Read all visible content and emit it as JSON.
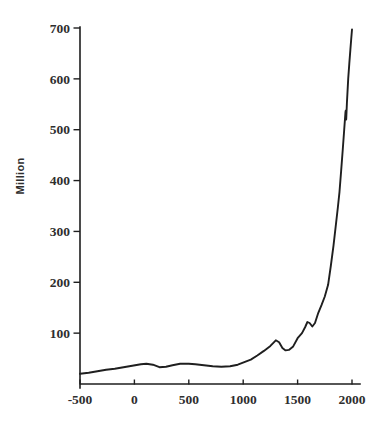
{
  "window": {
    "width": 381,
    "height": 423,
    "background": "#ffffff"
  },
  "chart_data": {
    "type": "line",
    "ylabel": "Million",
    "x_ticks": [
      -500,
      0,
      500,
      1000,
      1500,
      2000
    ],
    "x_tick_labels": [
      "-500",
      "0",
      "500",
      "1000",
      "1500",
      "2000"
    ],
    "y_ticks": [
      100,
      200,
      300,
      400,
      500,
      600,
      700
    ],
    "y_tick_labels": [
      "100",
      "200",
      "300",
      "400",
      "500",
      "600",
      "700"
    ],
    "xlim": [
      -500,
      2000
    ],
    "ylim": [
      0,
      700
    ],
    "grid": false,
    "legend": false,
    "line_color": "#1f1f1f",
    "axis_color": "#1f1f1f",
    "label_color": "#2e2e2e",
    "series": [
      {
        "name": "population-million",
        "points": [
          [
            -500,
            20
          ],
          [
            -420,
            22
          ],
          [
            -340,
            25
          ],
          [
            -260,
            28
          ],
          [
            -180,
            30
          ],
          [
            -100,
            33
          ],
          [
            -20,
            36
          ],
          [
            60,
            39
          ],
          [
            110,
            40
          ],
          [
            170,
            38
          ],
          [
            230,
            33
          ],
          [
            290,
            34
          ],
          [
            350,
            37
          ],
          [
            420,
            40
          ],
          [
            500,
            40
          ],
          [
            560,
            39
          ],
          [
            640,
            37
          ],
          [
            720,
            35
          ],
          [
            800,
            34
          ],
          [
            880,
            35
          ],
          [
            950,
            38
          ],
          [
            1010,
            43
          ],
          [
            1070,
            48
          ],
          [
            1130,
            56
          ],
          [
            1190,
            65
          ],
          [
            1250,
            75
          ],
          [
            1300,
            86
          ],
          [
            1330,
            82
          ],
          [
            1360,
            71
          ],
          [
            1390,
            66
          ],
          [
            1420,
            67
          ],
          [
            1460,
            74
          ],
          [
            1500,
            90
          ],
          [
            1540,
            100
          ],
          [
            1570,
            112
          ],
          [
            1590,
            122
          ],
          [
            1610,
            120
          ],
          [
            1635,
            113
          ],
          [
            1660,
            120
          ],
          [
            1690,
            140
          ],
          [
            1720,
            155
          ],
          [
            1750,
            172
          ],
          [
            1780,
            195
          ],
          [
            1805,
            232
          ],
          [
            1830,
            272
          ],
          [
            1850,
            310
          ],
          [
            1870,
            348
          ],
          [
            1885,
            378
          ],
          [
            1900,
            418
          ],
          [
            1915,
            462
          ],
          [
            1928,
            500
          ],
          [
            1940,
            535
          ],
          [
            1943,
            538
          ],
          [
            1947,
            520
          ],
          [
            1953,
            552
          ],
          [
            1965,
            600
          ],
          [
            1975,
            630
          ],
          [
            1985,
            658
          ],
          [
            1993,
            678
          ],
          [
            2000,
            697
          ]
        ]
      }
    ]
  }
}
